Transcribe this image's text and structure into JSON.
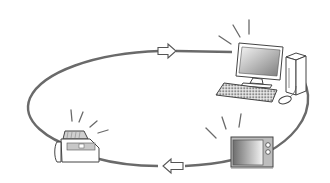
{
  "diagram": {
    "type": "cycle",
    "direction": "clockwise",
    "nodes": [
      {
        "id": "computer",
        "label": "",
        "icon": "desktop-computer-icon",
        "position": "top-right",
        "emitting_signal": true
      },
      {
        "id": "tv",
        "label": "",
        "icon": "television-icon",
        "position": "bottom-right",
        "emitting_signal": true
      },
      {
        "id": "fax",
        "label": "",
        "icon": "fax-machine-icon",
        "position": "bottom-left",
        "emitting_signal": true
      }
    ],
    "arrows": [
      {
        "position": "top-center",
        "points": "right"
      },
      {
        "position": "bottom-center",
        "points": "left"
      }
    ],
    "colors": {
      "line": "#6a6a6a",
      "outline": "#444444",
      "background": "#ffffff",
      "screen_dark": "#8a8a8a",
      "screen_light": "#f2f2f2"
    }
  }
}
